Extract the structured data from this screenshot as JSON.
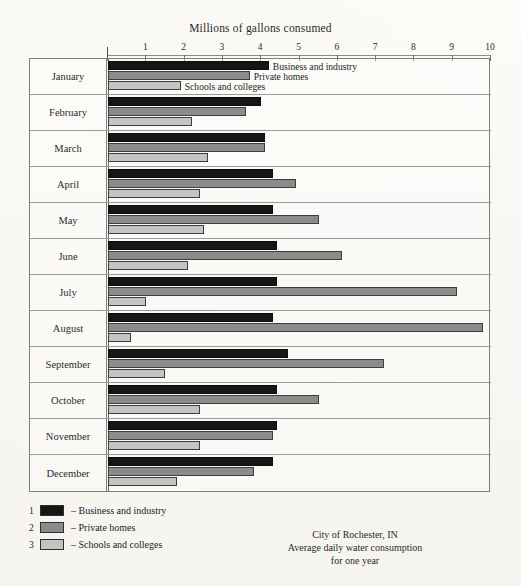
{
  "chart_data": {
    "type": "bar",
    "orientation": "horizontal",
    "title": "Millions of gallons consumed",
    "xlabel": "Millions of gallons consumed",
    "ylabel": "",
    "xlim": [
      0,
      10.6
    ],
    "xticks": [
      1,
      2,
      3,
      4,
      5,
      6,
      7,
      8,
      9,
      10
    ],
    "grid": false,
    "legend_position": "below-left",
    "categories": [
      "January",
      "February",
      "March",
      "April",
      "May",
      "June",
      "July",
      "August",
      "September",
      "October",
      "November",
      "December"
    ],
    "series": [
      {
        "name": "Business and industry",
        "legend_number": "1",
        "color": "#161616",
        "values": [
          4.2,
          4.0,
          4.1,
          4.3,
          4.3,
          4.4,
          4.4,
          4.3,
          4.7,
          4.4,
          4.4,
          4.3
        ]
      },
      {
        "name": "Private homes",
        "legend_number": "2",
        "color": "#8b8b8b",
        "values": [
          3.7,
          3.6,
          4.1,
          4.9,
          5.5,
          6.1,
          9.1,
          9.8,
          7.2,
          5.5,
          4.3,
          3.8
        ]
      },
      {
        "name": "Schools and colleges",
        "legend_number": "3",
        "color": "#c4c4c4",
        "values": [
          1.9,
          2.2,
          2.6,
          2.4,
          2.5,
          2.1,
          1.0,
          0.6,
          1.5,
          2.4,
          2.4,
          1.8
        ]
      }
    ],
    "annotations": [
      {
        "text": "Business and industry",
        "row": "January",
        "series": 1
      },
      {
        "text": "Private homes",
        "row": "January",
        "series": 2
      },
      {
        "text": "Schools and colleges",
        "row": "January",
        "series": 3
      }
    ],
    "caption_lines": [
      "City of Rochester, IN",
      "Average daily water consumption",
      "for one year"
    ]
  },
  "axis": {
    "title": "Millions of gallons consumed",
    "ticks": [
      "1",
      "2",
      "3",
      "4",
      "5",
      "6",
      "7",
      "8",
      "9",
      "10"
    ]
  },
  "rows": [
    {
      "label": "January"
    },
    {
      "label": "February"
    },
    {
      "label": "March"
    },
    {
      "label": "April"
    },
    {
      "label": "May"
    },
    {
      "label": "June"
    },
    {
      "label": "July"
    },
    {
      "label": "August"
    },
    {
      "label": "September"
    },
    {
      "label": "October"
    },
    {
      "label": "November"
    },
    {
      "label": "December"
    }
  ],
  "inline_labels": {
    "business": "Business and industry",
    "homes": "Private homes",
    "schools": "Schools and colleges"
  },
  "legend": [
    {
      "num": "1",
      "dash": "–",
      "label": "Business and industry"
    },
    {
      "num": "2",
      "dash": "–",
      "label": "Private homes"
    },
    {
      "num": "3",
      "dash": "–",
      "label": "Schools and colleges"
    }
  ],
  "caption": {
    "line1": "City of Rochester, IN",
    "line2": "Average daily water consumption",
    "line3": "for one year"
  }
}
